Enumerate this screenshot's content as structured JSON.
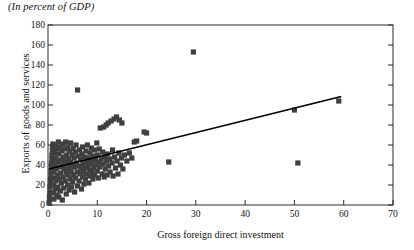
{
  "caption": "(In percent of GDP)",
  "chart_data": {
    "type": "scatter",
    "title": "(In percent of GDP)",
    "xlabel": "Gross foreign direct investment",
    "ylabel": "Exports of goods and services",
    "xlim": [
      0,
      70
    ],
    "ylim": [
      0,
      180
    ],
    "xticks": [
      0,
      10,
      20,
      30,
      40,
      50,
      60,
      70
    ],
    "yticks": [
      0,
      20,
      40,
      60,
      80,
      100,
      120,
      140,
      160,
      180
    ],
    "xtick_labels": [
      "0",
      "10",
      "20",
      "30",
      "40",
      "50",
      "60",
      "70"
    ],
    "ytick_labels": [
      "0",
      "20",
      "40",
      "60",
      "80",
      "100",
      "120",
      "140",
      "160",
      "180"
    ],
    "grid": false,
    "legend": "none",
    "marker_style": "filled-square",
    "marker_color": "#3f3f3f",
    "trendline": {
      "type": "linear",
      "color": "#000000",
      "x_start": 0.2,
      "y_start": 36,
      "x_end": 59.5,
      "y_end": 108.5
    },
    "points": [
      [
        0.2,
        2
      ],
      [
        0.3,
        5
      ],
      [
        0.3,
        9
      ],
      [
        0.4,
        13
      ],
      [
        0.4,
        18
      ],
      [
        0.5,
        22
      ],
      [
        0.5,
        26
      ],
      [
        0.6,
        30
      ],
      [
        0.6,
        34
      ],
      [
        0.7,
        38
      ],
      [
        0.7,
        42
      ],
      [
        0.8,
        46
      ],
      [
        0.8,
        50
      ],
      [
        0.9,
        54
      ],
      [
        0.9,
        58
      ],
      [
        1.0,
        61
      ],
      [
        1.0,
        44
      ],
      [
        1.1,
        20
      ],
      [
        1.1,
        12
      ],
      [
        1.2,
        6
      ],
      [
        1.2,
        33
      ],
      [
        1.3,
        27
      ],
      [
        1.3,
        52
      ],
      [
        1.4,
        40
      ],
      [
        1.5,
        16
      ],
      [
        1.5,
        60
      ],
      [
        1.6,
        24
      ],
      [
        1.6,
        47
      ],
      [
        1.7,
        36
      ],
      [
        1.8,
        10
      ],
      [
        1.8,
        56
      ],
      [
        1.9,
        30
      ],
      [
        2.0,
        43
      ],
      [
        2.0,
        18
      ],
      [
        2.1,
        63
      ],
      [
        2.2,
        51
      ],
      [
        2.2,
        8
      ],
      [
        2.3,
        26
      ],
      [
        2.4,
        38
      ],
      [
        2.4,
        58
      ],
      [
        2.5,
        14
      ],
      [
        2.6,
        45
      ],
      [
        2.6,
        32
      ],
      [
        2.7,
        22
      ],
      [
        2.8,
        54
      ],
      [
        2.9,
        40
      ],
      [
        2.9,
        5
      ],
      [
        3.0,
        61
      ],
      [
        3.1,
        28
      ],
      [
        3.1,
        48
      ],
      [
        3.2,
        17
      ],
      [
        3.3,
        36
      ],
      [
        3.4,
        56
      ],
      [
        3.4,
        44
      ],
      [
        3.5,
        24
      ],
      [
        3.6,
        63
      ],
      [
        3.7,
        33
      ],
      [
        3.7,
        11
      ],
      [
        3.8,
        50
      ],
      [
        3.9,
        41
      ],
      [
        4.0,
        20
      ],
      [
        4.0,
        58
      ],
      [
        4.1,
        30
      ],
      [
        4.2,
        46
      ],
      [
        4.3,
        37
      ],
      [
        4.3,
        15
      ],
      [
        4.4,
        54
      ],
      [
        4.5,
        26
      ],
      [
        4.6,
        62
      ],
      [
        4.6,
        43
      ],
      [
        4.7,
        34
      ],
      [
        4.8,
        18
      ],
      [
        4.9,
        50
      ],
      [
        5.0,
        40
      ],
      [
        5.0,
        23
      ],
      [
        5.1,
        57
      ],
      [
        5.2,
        30
      ],
      [
        5.3,
        47
      ],
      [
        5.4,
        38
      ],
      [
        5.4,
        13
      ],
      [
        5.5,
        53
      ],
      [
        5.6,
        27
      ],
      [
        5.7,
        60
      ],
      [
        5.8,
        42
      ],
      [
        5.9,
        33
      ],
      [
        6.0,
        19
      ],
      [
        6.0,
        115
      ],
      [
        6.1,
        49
      ],
      [
        6.2,
        39
      ],
      [
        6.3,
        24
      ],
      [
        6.4,
        55
      ],
      [
        6.5,
        31
      ],
      [
        6.6,
        46
      ],
      [
        6.7,
        36
      ],
      [
        6.8,
        16
      ],
      [
        6.9,
        51
      ],
      [
        7.0,
        28
      ],
      [
        7.0,
        58
      ],
      [
        7.1,
        41
      ],
      [
        7.2,
        33
      ],
      [
        7.3,
        21
      ],
      [
        7.4,
        48
      ],
      [
        7.5,
        37
      ],
      [
        7.6,
        26
      ],
      [
        7.7,
        54
      ],
      [
        7.8,
        43
      ],
      [
        7.9,
        31
      ],
      [
        8.0,
        60
      ],
      [
        8.1,
        39
      ],
      [
        8.2,
        47
      ],
      [
        8.3,
        22
      ],
      [
        8.4,
        35
      ],
      [
        8.5,
        52
      ],
      [
        8.6,
        29
      ],
      [
        8.7,
        44
      ],
      [
        8.8,
        57
      ],
      [
        8.9,
        33
      ],
      [
        9.0,
        41
      ],
      [
        9.1,
        26
      ],
      [
        9.2,
        49
      ],
      [
        9.3,
        37
      ],
      [
        9.4,
        55
      ],
      [
        9.5,
        30
      ],
      [
        9.6,
        45
      ],
      [
        9.8,
        40
      ],
      [
        9.9,
        62
      ],
      [
        10.0,
        34
      ],
      [
        10.1,
        50
      ],
      [
        10.2,
        27
      ],
      [
        10.3,
        43
      ],
      [
        10.4,
        56
      ],
      [
        10.5,
        38
      ],
      [
        10.6,
        77
      ],
      [
        10.8,
        46
      ],
      [
        11.0,
        31
      ],
      [
        11.1,
        53
      ],
      [
        11.2,
        41
      ],
      [
        11.3,
        78
      ],
      [
        11.4,
        28
      ],
      [
        11.5,
        48
      ],
      [
        11.6,
        36
      ],
      [
        11.8,
        80
      ],
      [
        11.9,
        44
      ],
      [
        12.0,
        30
      ],
      [
        12.1,
        51
      ],
      [
        12.2,
        82
      ],
      [
        12.3,
        39
      ],
      [
        12.5,
        46
      ],
      [
        12.6,
        33
      ],
      [
        12.8,
        84
      ],
      [
        13.0,
        42
      ],
      [
        13.1,
        55
      ],
      [
        13.2,
        29
      ],
      [
        13.4,
        86
      ],
      [
        13.5,
        48
      ],
      [
        13.7,
        37
      ],
      [
        13.9,
        88
      ],
      [
        14.0,
        44
      ],
      [
        14.2,
        31
      ],
      [
        14.4,
        52
      ],
      [
        14.5,
        85
      ],
      [
        14.7,
        40
      ],
      [
        14.9,
        47
      ],
      [
        15.0,
        82
      ],
      [
        15.2,
        36
      ],
      [
        15.5,
        50
      ],
      [
        16.0,
        44
      ],
      [
        16.5,
        52
      ],
      [
        17.0,
        47
      ],
      [
        17.5,
        63
      ],
      [
        18.0,
        64
      ],
      [
        19.5,
        73
      ],
      [
        20.0,
        72
      ],
      [
        24.5,
        43
      ],
      [
        29.5,
        153
      ],
      [
        50.0,
        95
      ],
      [
        50.7,
        42
      ],
      [
        59.0,
        104
      ]
    ]
  }
}
